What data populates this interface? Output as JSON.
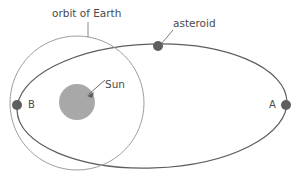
{
  "diagram": {
    "labels": {
      "orbit_of_earth": "orbit of Earth",
      "asteroid": "asteroid",
      "sun": "Sun",
      "point_a": "A",
      "point_b": "B"
    },
    "colors": {
      "earth_orbit_stroke": "#9a9a9a",
      "asteroid_orbit_stroke": "#5e5e5e",
      "sun_fill": "#a8a8a8",
      "dot_fill": "#5e5e5e",
      "leader_line": "#6e6e6e",
      "text": "#4a4a4a",
      "background": "#ffffff"
    },
    "geometry": {
      "earth_orbit": {
        "shape": "circle",
        "cx": 77,
        "cy": 103,
        "r": 67
      },
      "asteroid_orbit": {
        "shape": "ellipse",
        "cx": 152,
        "cy": 106,
        "rx": 135,
        "ry": 62,
        "rotation_deg": -2
      },
      "sun": {
        "shape": "circle",
        "cx": 77,
        "cy": 102,
        "r": 18
      },
      "asteroid_dot": {
        "cx": 158,
        "cy": 46,
        "r": 5
      },
      "point_a_dot": {
        "cx": 286,
        "cy": 105,
        "r": 5
      },
      "point_b_dot": {
        "cx": 17,
        "cy": 105,
        "r": 5
      }
    },
    "leaders": {
      "orbit_of_earth": {
        "x1": 88,
        "y1": 22,
        "x2": 88,
        "y2": 37
      },
      "asteroid": {
        "x1": 172,
        "y1": 30,
        "x2": 162,
        "y2": 43
      },
      "sun": {
        "x1": 104,
        "y1": 80,
        "x2": 88,
        "y2": 94
      }
    }
  }
}
